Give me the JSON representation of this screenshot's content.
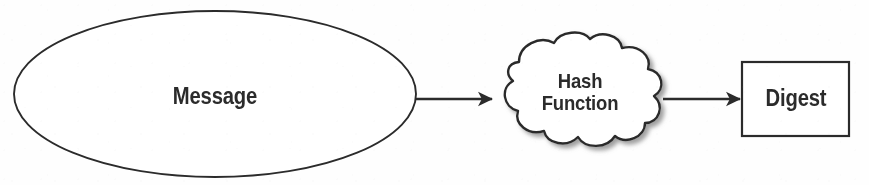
{
  "diagram": {
    "background_color": "#fefefe",
    "stroke_color": "#2b2b2b",
    "shadow_color": "#9a9a9a",
    "nodes": [
      {
        "id": "message",
        "shape": "ellipse",
        "label": "Message",
        "cx": 215,
        "cy": 94,
        "rx": 201,
        "ry": 83
      },
      {
        "id": "hash-function",
        "shape": "cloud",
        "label": "Hash\nFunction",
        "label_lines": [
          "Hash",
          "Function"
        ],
        "cx": 580,
        "cy": 95,
        "width": 172,
        "height": 112
      },
      {
        "id": "digest",
        "shape": "rectangle",
        "label": "Digest",
        "x": 742,
        "y": 62,
        "width": 107,
        "height": 74
      }
    ],
    "edges": [
      {
        "id": "message-to-hash",
        "from": "message",
        "to": "hash-function",
        "arrow": "single",
        "x1": 417,
        "x2": 493,
        "y": 99
      },
      {
        "id": "hash-to-digest",
        "from": "hash-function",
        "to": "digest",
        "arrow": "single",
        "x1": 663,
        "x2": 741,
        "y": 99
      }
    ]
  }
}
